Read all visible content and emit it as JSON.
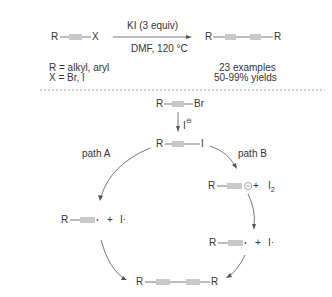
{
  "scheme": {
    "reaction": {
      "reactant": {
        "r": "R",
        "x": "X"
      },
      "reagent_above": "KI (3 equiv)",
      "conditions_below": "DMF, 120 °C",
      "product": {
        "r_left": "R",
        "r_right": "R"
      },
      "substituents": [
        "R = alkyl, aryl",
        "X = Br, I"
      ],
      "results": [
        "23 examples",
        "50-99% yields"
      ]
    },
    "mechanism": {
      "start": {
        "r": "R",
        "halide": "Br"
      },
      "step1_reagent": "I",
      "intermediate": {
        "r": "R",
        "halide": "I"
      },
      "path_a_label": "path A",
      "path_b_label": "path B",
      "path_a_species": {
        "r": "R",
        "plus": "+",
        "radical": "I·"
      },
      "path_b_anion": {
        "r": "R",
        "plus": "+",
        "i2": "I",
        "i2_sub": "2"
      },
      "path_b_radicals": {
        "r": "R",
        "plus": "+",
        "radical": "I·"
      },
      "final_product": {
        "r_left": "R",
        "r_right": "R"
      }
    }
  }
}
